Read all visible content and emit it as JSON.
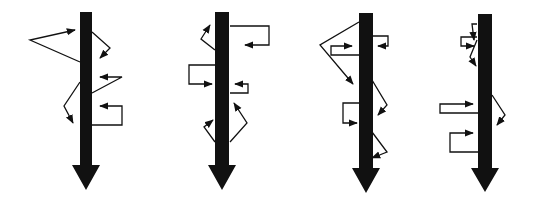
{
  "figure": {
    "colors": {
      "background": "#ffffff",
      "ink": "#111111"
    },
    "diagrams": [
      {
        "id": "diagram-1",
        "shaft": {
          "x": 86,
          "top": 12,
          "bottom": 165,
          "width": 12,
          "head_width": 28,
          "head_tip": 190
        },
        "paths": [
          {
            "kind": "zigzag",
            "points": [
              [
                80,
                62
              ],
              [
                30,
                40
              ],
              [
                75,
                30
              ]
            ]
          },
          {
            "kind": "zigzag",
            "points": [
              [
                92,
                32
              ],
              [
                110,
                48
              ],
              [
                100,
                58
              ]
            ]
          },
          {
            "kind": "zigzag",
            "points": [
              [
                92,
                93
              ],
              [
                122,
                77
              ],
              [
                100,
                77
              ]
            ]
          },
          {
            "kind": "zigzag",
            "points": [
              [
                80,
                82
              ],
              [
                64,
                106
              ],
              [
                73,
                123
              ]
            ]
          },
          {
            "kind": "loop",
            "points": [
              [
                92,
                125
              ],
              [
                122,
                125
              ],
              [
                122,
                106
              ],
              [
                100,
                106
              ]
            ]
          }
        ]
      },
      {
        "id": "diagram-2",
        "shaft": {
          "x": 222,
          "top": 12,
          "bottom": 165,
          "width": 14,
          "head_width": 28,
          "head_tip": 190
        },
        "paths": [
          {
            "kind": "zigzag",
            "points": [
              [
                215,
                50
              ],
              [
                201,
                39
              ],
              [
                210,
                25
              ]
            ]
          },
          {
            "kind": "loop",
            "points": [
              [
                230,
                26
              ],
              [
                269,
                26
              ],
              [
                269,
                45
              ],
              [
                245,
                45
              ]
            ]
          },
          {
            "kind": "loop",
            "points": [
              [
                215,
                65
              ],
              [
                189,
                65
              ],
              [
                189,
                84
              ],
              [
                212,
                84
              ]
            ]
          },
          {
            "kind": "loop",
            "points": [
              [
                230,
                93
              ],
              [
                248,
                93
              ],
              [
                248,
                84
              ],
              [
                235,
                84
              ]
            ]
          },
          {
            "kind": "zigzag",
            "points": [
              [
                215,
                142
              ],
              [
                204,
                127
              ],
              [
                213,
                120
              ]
            ]
          },
          {
            "kind": "zigzag",
            "points": [
              [
                230,
                142
              ],
              [
                247,
                123
              ],
              [
                234,
                103
              ]
            ]
          }
        ]
      },
      {
        "id": "diagram-3",
        "shaft": {
          "x": 366,
          "top": 13,
          "bottom": 168,
          "width": 14,
          "head_width": 28,
          "head_tip": 193
        },
        "paths": [
          {
            "kind": "zigzag",
            "points": [
              [
                359,
                22
              ],
              [
                320,
                45
              ],
              [
                353,
                84
              ]
            ]
          },
          {
            "kind": "loop",
            "points": [
              [
                359,
                55
              ],
              [
                331,
                55
              ],
              [
                331,
                46
              ],
              [
                352,
                46
              ]
            ]
          },
          {
            "kind": "loop",
            "points": [
              [
                372,
                36
              ],
              [
                388,
                36
              ],
              [
                388,
                46
              ],
              [
                378,
                46
              ]
            ]
          },
          {
            "kind": "zigzag",
            "points": [
              [
                372,
                80
              ],
              [
                387,
                105
              ],
              [
                378,
                115
              ]
            ]
          },
          {
            "kind": "loop",
            "points": [
              [
                359,
                103
              ],
              [
                343,
                103
              ],
              [
                343,
                123
              ],
              [
                357,
                123
              ]
            ]
          },
          {
            "kind": "zigzag",
            "points": [
              [
                372,
                132
              ],
              [
                387,
                152
              ],
              [
                372,
                158
              ]
            ]
          }
        ]
      },
      {
        "id": "diagram-4",
        "shaft": {
          "x": 485,
          "top": 14,
          "bottom": 168,
          "width": 14,
          "head_width": 28,
          "head_tip": 192
        },
        "paths": [
          {
            "kind": "zigzag",
            "points": [
              [
                477,
                24
              ],
              [
                472,
                24
              ],
              [
                474,
                40
              ]
            ]
          },
          {
            "kind": "loop",
            "points": [
              [
                477,
                37
              ],
              [
                461,
                37
              ],
              [
                461,
                46
              ],
              [
                474,
                46
              ]
            ]
          },
          {
            "kind": "zigzag",
            "points": [
              [
                477,
                40
              ],
              [
                470,
                57
              ],
              [
                476,
                66
              ]
            ]
          },
          {
            "kind": "loop",
            "points": [
              [
                478,
                113
              ],
              [
                440,
                113
              ],
              [
                440,
                104
              ],
              [
                473,
                104
              ]
            ]
          },
          {
            "kind": "loop",
            "points": [
              [
                478,
                152
              ],
              [
                450,
                152
              ],
              [
                450,
                133
              ],
              [
                473,
                133
              ]
            ]
          },
          {
            "kind": "zigzag",
            "points": [
              [
                492,
                95
              ],
              [
                505,
                115
              ],
              [
                497,
                125
              ]
            ]
          }
        ]
      }
    ]
  }
}
